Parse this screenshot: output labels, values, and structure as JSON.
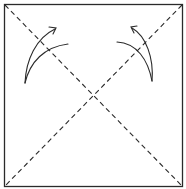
{
  "diagram": {
    "type": "origami-fold-diagram",
    "colors": {
      "line": "#2a2a2a",
      "background": "#ffffff"
    },
    "square": {
      "x": 4,
      "y": 4,
      "width": 179,
      "height": 183
    },
    "fold_lines": [
      {
        "name": "diagonal-top-left-to-bottom-right",
        "style": "dashed"
      },
      {
        "name": "diagonal-top-right-to-bottom-left",
        "style": "dashed"
      }
    ],
    "arrows": [
      {
        "name": "left-fold-arrow",
        "direction": "up-right"
      },
      {
        "name": "right-fold-arrow",
        "direction": "up-left"
      }
    ]
  }
}
